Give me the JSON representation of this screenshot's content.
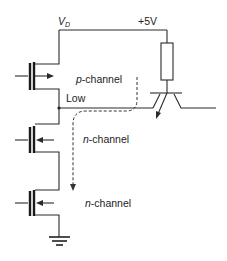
{
  "diagram": {
    "type": "circuit-schematic",
    "labels": {
      "supply_node": "V",
      "supply_node_sub": "D",
      "supply_voltage": "+5V",
      "output_node": "Low",
      "transistor_1_prefix": "p",
      "transistor_1_suffix": "-channel",
      "transistor_2_prefix": "n",
      "transistor_2_suffix": "-channel",
      "transistor_3_prefix": "n",
      "transistor_3_suffix": "-channel"
    },
    "components": [
      {
        "id": "Q1",
        "kind": "MOSFET",
        "polarity": "p-channel"
      },
      {
        "id": "Q2",
        "kind": "MOSFET",
        "polarity": "n-channel"
      },
      {
        "id": "Q3",
        "kind": "MOSFET",
        "polarity": "n-channel"
      },
      {
        "id": "R1",
        "kind": "resistor"
      },
      {
        "id": "T1",
        "kind": "bipolar-transistor"
      },
      {
        "id": "GND",
        "kind": "ground"
      }
    ],
    "current_path": "dashed arrow from BJT emitter through Low node down to n-channel transistors",
    "colors": {
      "ink": "#2a2a2a",
      "background": "#ffffff"
    }
  }
}
